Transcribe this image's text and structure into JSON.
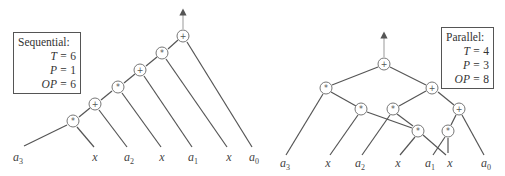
{
  "sequential": {
    "box": {
      "title": "Sequential:",
      "metrics": [
        {
          "name": "T",
          "value": "6"
        },
        {
          "name": "P",
          "value": "1"
        },
        {
          "name": "OP",
          "value": "6"
        }
      ]
    },
    "nodes": [
      {
        "id": "s1",
        "op": "*",
        "x": 73,
        "y": 121
      },
      {
        "id": "s2",
        "op": "+",
        "x": 95,
        "y": 104
      },
      {
        "id": "s3",
        "op": "*",
        "x": 118,
        "y": 87
      },
      {
        "id": "s4",
        "op": "+",
        "x": 140,
        "y": 70
      },
      {
        "id": "s5",
        "op": "*",
        "x": 162,
        "y": 53
      },
      {
        "id": "s6",
        "op": "+",
        "x": 183,
        "y": 36
      }
    ],
    "leaves": [
      {
        "var": "a",
        "sub": "3",
        "x": 18,
        "y": 155
      },
      {
        "var": "x",
        "sub": "",
        "x": 95,
        "y": 155
      },
      {
        "var": "a",
        "sub": "2",
        "x": 129,
        "y": 155
      },
      {
        "var": "x",
        "sub": "",
        "x": 162,
        "y": 155
      },
      {
        "var": "a",
        "sub": "1",
        "x": 193,
        "y": 155
      },
      {
        "var": "x",
        "sub": "",
        "x": 229,
        "y": 155
      },
      {
        "var": "a",
        "sub": "0",
        "x": 254,
        "y": 155
      }
    ]
  },
  "parallel": {
    "box": {
      "title": "Parallel:",
      "metrics": [
        {
          "name": "T",
          "value": "4"
        },
        {
          "name": "P",
          "value": "3"
        },
        {
          "name": "OP",
          "value": "8"
        }
      ]
    },
    "nodes": [
      {
        "id": "p1",
        "op": "+",
        "x": 384,
        "y": 64
      },
      {
        "id": "p2",
        "op": "*",
        "x": 326,
        "y": 88
      },
      {
        "id": "p3",
        "op": "+",
        "x": 432,
        "y": 88
      },
      {
        "id": "p4",
        "op": "*",
        "x": 361,
        "y": 109
      },
      {
        "id": "p5",
        "op": "*",
        "x": 393,
        "y": 109
      },
      {
        "id": "p6",
        "op": "+",
        "x": 459,
        "y": 109
      },
      {
        "id": "p7",
        "op": "*",
        "x": 418,
        "y": 131
      },
      {
        "id": "p8",
        "op": "*",
        "x": 448,
        "y": 131
      }
    ],
    "leaves": [
      {
        "var": "a",
        "sub": "3",
        "x": 285,
        "y": 163
      },
      {
        "var": "x",
        "sub": "",
        "x": 328,
        "y": 163
      },
      {
        "var": "a",
        "sub": "2",
        "x": 360,
        "y": 163
      },
      {
        "var": "x",
        "sub": "",
        "x": 398,
        "y": 163
      },
      {
        "var": "a",
        "sub": "1",
        "x": 430,
        "y": 163
      },
      {
        "var": "x",
        "sub": "",
        "x": 450,
        "y": 163
      },
      {
        "var": "a",
        "sub": "0",
        "x": 486,
        "y": 163
      }
    ]
  },
  "colors": {
    "line": "#555555",
    "node_stroke": "#777777"
  }
}
